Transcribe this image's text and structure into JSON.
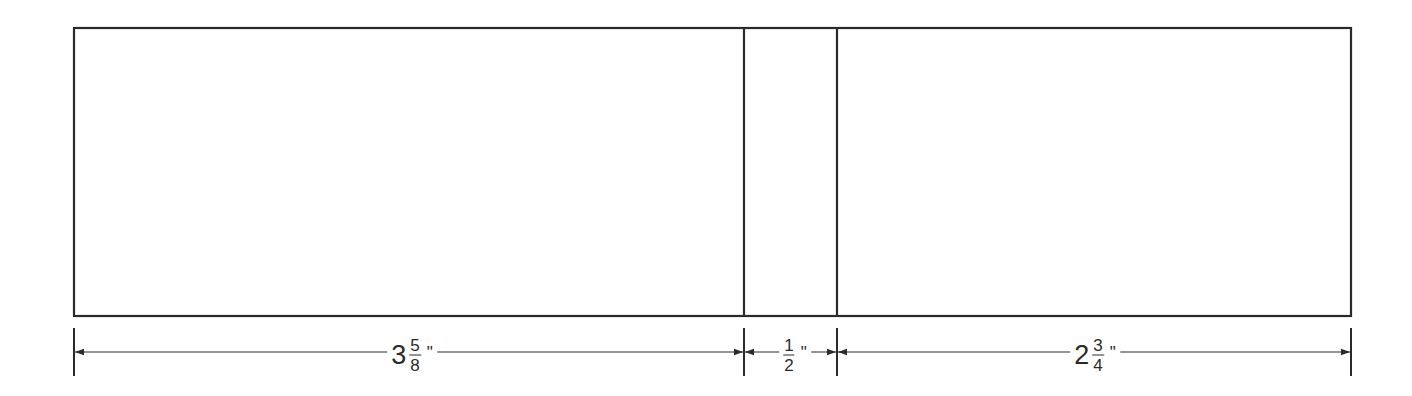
{
  "diagram": {
    "type": "dimensioned-panel-layout",
    "stroke_color": "#2a2a2a",
    "outline": {
      "x": 74,
      "y": 28,
      "width": 1277,
      "height": 288
    },
    "dividers_x": [
      744,
      837
    ],
    "dimension_line_y": 352,
    "extension_lines": {
      "top": 328,
      "bottom": 376,
      "x": [
        74,
        744,
        837,
        1351
      ]
    },
    "sections": [
      {
        "name": "left-panel",
        "x_start": 74,
        "x_end": 744,
        "whole": "3",
        "numerator": "5",
        "denominator": "8",
        "unit": "\"",
        "label_x": 412
      },
      {
        "name": "middle-panel",
        "x_start": 744,
        "x_end": 837,
        "whole": "",
        "numerator": "1",
        "denominator": "2",
        "unit": "\"",
        "label_x": 795
      },
      {
        "name": "right-panel",
        "x_start": 837,
        "x_end": 1351,
        "whole": "2",
        "numerator": "3",
        "denominator": "4",
        "unit": "\"",
        "label_x": 1095
      }
    ]
  }
}
